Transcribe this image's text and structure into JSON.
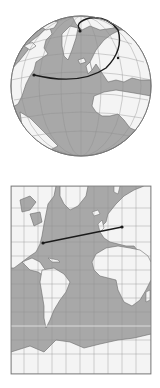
{
  "figures": [
    {
      "id": "globe",
      "projection": "orthographic",
      "route_type": "great-circle",
      "route_description": "curved arc from eastern North America over Greenland/Arctic toward Europe"
    },
    {
      "id": "mercator",
      "projection": "mercator",
      "route_type": "straight line",
      "route_description": "straight line from eastern North America to Europe"
    }
  ],
  "colors": {
    "ocean": "#a8a8a8",
    "land": "#f4f4f4",
    "coast": "#6a6a6a",
    "grid": "#8e8e8e",
    "route": "#1a1a1a",
    "equator": "#e8e8e8",
    "background": "#ffffff"
  }
}
